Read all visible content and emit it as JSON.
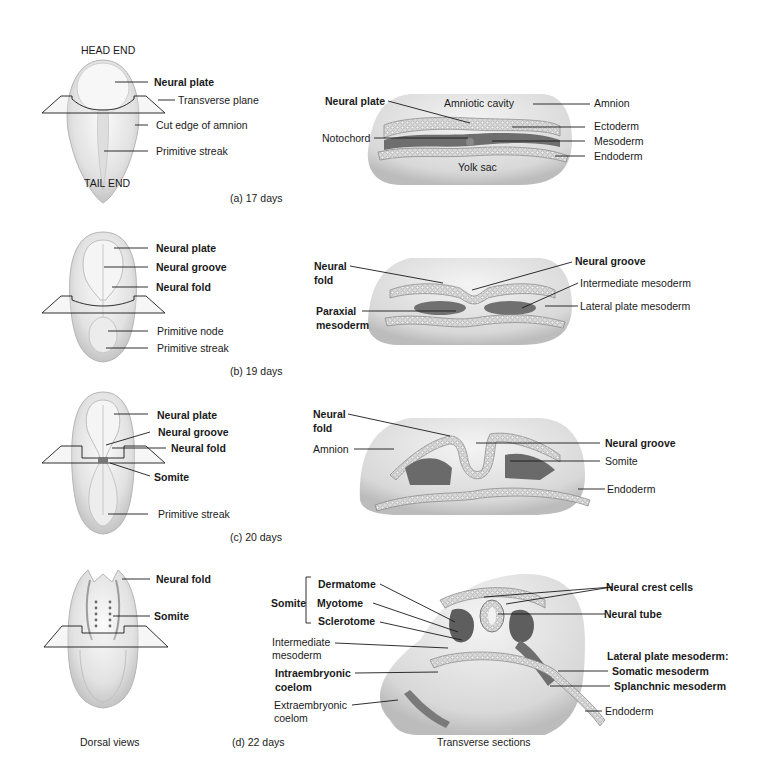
{
  "figure": {
    "domain": "embryology",
    "bottom_captions": {
      "left": "Dorsal views",
      "right": "Transverse sections"
    },
    "panels": [
      {
        "id": "a",
        "caption": "(a) 17 days",
        "dorsal": {
          "orientation_top": "HEAD END",
          "orientation_bottom": "TAIL END",
          "labels": [
            "Neural plate",
            "Transverse plane",
            "Cut edge of amnion",
            "Primitive streak"
          ],
          "bold": [
            true,
            false,
            false,
            false
          ]
        },
        "section": {
          "labels": [
            "Neural plate",
            "Notochord",
            "Amniotic cavity",
            "Amnion",
            "Ectoderm",
            "Mesoderm",
            "Endoderm",
            "Yolk sac"
          ],
          "bold": [
            true,
            false,
            false,
            false,
            false,
            false,
            false,
            false
          ]
        }
      },
      {
        "id": "b",
        "caption": "(b) 19 days",
        "dorsal": {
          "labels": [
            "Neural plate",
            "Neural groove",
            "Neural fold",
            "Primitive node",
            "Primitive streak"
          ],
          "bold": [
            true,
            true,
            true,
            false,
            false
          ]
        },
        "section": {
          "labels": [
            "Neural fold",
            "Paraxial mesoderm",
            "Neural groove",
            "Intermediate mesoderm",
            "Lateral plate mesoderm"
          ],
          "bold": [
            true,
            true,
            true,
            false,
            false
          ]
        }
      },
      {
        "id": "c",
        "caption": "(c) 20 days",
        "dorsal": {
          "labels": [
            "Neural plate",
            "Neural groove",
            "Neural fold",
            "Somite",
            "Primitive streak"
          ],
          "bold": [
            true,
            true,
            true,
            true,
            false
          ]
        },
        "section": {
          "labels": [
            "Neural fold",
            "Amnion",
            "Neural groove",
            "Somite",
            "Endoderm"
          ],
          "bold": [
            true,
            false,
            true,
            false,
            false
          ]
        }
      },
      {
        "id": "d",
        "caption": "(d) 22 days",
        "dorsal": {
          "labels": [
            "Neural fold",
            "Somite"
          ],
          "bold": [
            true,
            true
          ]
        },
        "section": {
          "somite_group": "Somite",
          "somite_parts": [
            "Dermatome",
            "Myotome",
            "Sclerotome"
          ],
          "labels": [
            "Intermediate mesoderm",
            "Intraembryonic coelom",
            "Extraembryonic coelom",
            "Neural crest cells",
            "Neural tube",
            "Lateral plate mesoderm:",
            "Somatic mesoderm",
            "Splanchnic mesoderm",
            "Endoderm"
          ]
        }
      }
    ]
  },
  "text": {
    "a_head": "HEAD END",
    "a_tail": "TAIL END",
    "a_np": "Neural plate",
    "a_tp": "Transverse plane",
    "a_ce": "Cut edge of amnion",
    "a_ps": "Primitive streak",
    "a_cap": "(a) 17 days",
    "as_np": "Neural plate",
    "as_ac": "Amniotic cavity",
    "as_am": "Amnion",
    "as_no": "Notochord",
    "as_ec": "Ectoderm",
    "as_me": "Mesoderm",
    "as_en": "Endoderm",
    "as_ys": "Yolk sac",
    "b_np": "Neural plate",
    "b_ng": "Neural groove",
    "b_nf": "Neural fold",
    "b_pn": "Primitive node",
    "b_ps": "Primitive streak",
    "b_cap": "(b) 19 days",
    "bs_nf1": "Neural",
    "bs_nf2": "fold",
    "bs_ng": "Neural groove",
    "bs_im": "Intermediate mesoderm",
    "bs_pm1": "Paraxial",
    "bs_pm2": "mesoderm",
    "bs_lp": "Lateral plate mesoderm",
    "c_np": "Neural plate",
    "c_ng": "Neural groove",
    "c_nf": "Neural fold",
    "c_so": "Somite",
    "c_ps": "Primitive streak",
    "c_cap": "(c) 20 days",
    "cs_nf1": "Neural",
    "cs_nf2": "fold",
    "cs_am": "Amnion",
    "cs_ng": "Neural groove",
    "cs_so": "Somite",
    "cs_en": "Endoderm",
    "d_nf": "Neural fold",
    "d_so": "Somite",
    "d_cap": "(d) 22 days",
    "ds_somite": "Somite",
    "ds_der": "Dermatome",
    "ds_myo": "Myotome",
    "ds_scl": "Sclerotome",
    "ds_im1": "Intermediate",
    "ds_im2": "mesoderm",
    "ds_ic1": "Intraembryonic",
    "ds_ic2": "coelom",
    "ds_ec1": "Extraembryonic",
    "ds_ec2": "coelom",
    "ds_ncc": "Neural crest cells",
    "ds_nt": "Neural tube",
    "ds_lpm": "Lateral plate mesoderm:",
    "ds_som": "Somatic mesoderm",
    "ds_spl": "Splanchnic mesoderm",
    "ds_en": "Endoderm",
    "dorsal_views": "Dorsal views",
    "transverse_sections": "Transverse sections"
  },
  "colors": {
    "background": "#ffffff",
    "line": "#1a1a1a",
    "tissue_light": "#e6e6e6",
    "tissue_mid": "#bdbdbd",
    "tissue_dark": "#6e6e6e"
  }
}
